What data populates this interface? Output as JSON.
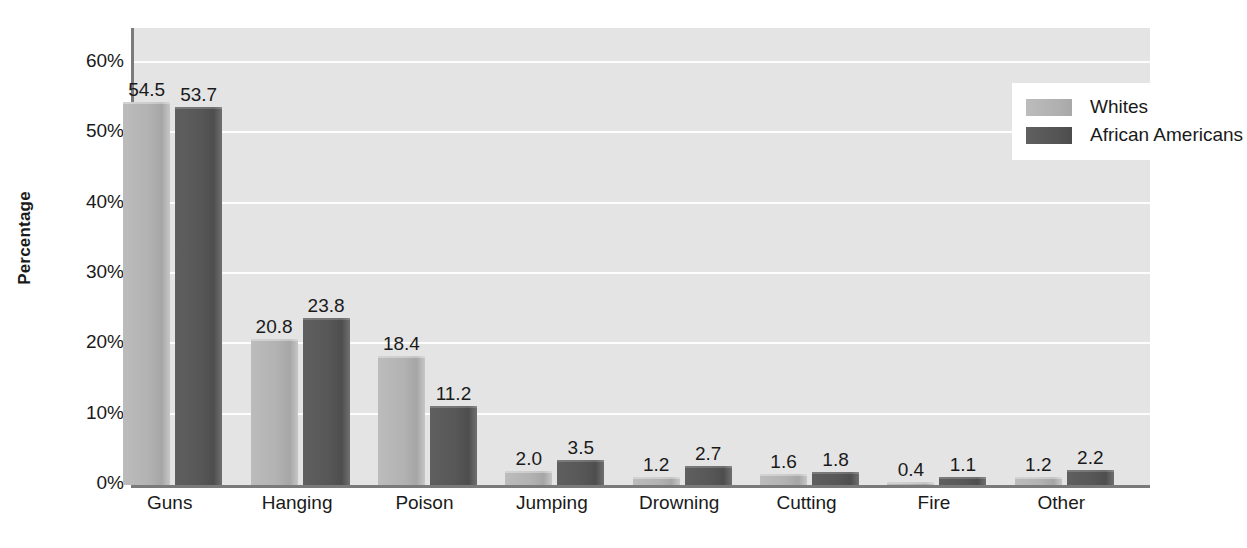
{
  "chart_data": {
    "type": "bar",
    "title": "",
    "xlabel": "",
    "ylabel": "Percentage",
    "ylim": [
      0,
      65
    ],
    "ytick_values": [
      0,
      10,
      20,
      30,
      40,
      50,
      60
    ],
    "ytick_labels": [
      "0%",
      "10%",
      "20%",
      "30%",
      "40%",
      "50%",
      "60%"
    ],
    "grid": true,
    "legend_position": "top-right",
    "categories": [
      "Guns",
      "Hanging",
      "Poison",
      "Jumping",
      "Drowning",
      "Cutting",
      "Fire",
      "Other"
    ],
    "series": [
      {
        "name": "Whites",
        "color": "#b0b0b0",
        "values": [
          54.5,
          20.8,
          18.4,
          2.0,
          1.2,
          1.6,
          0.4,
          1.2
        ],
        "labels": [
          "54.5",
          "20.8",
          "18.4",
          "2.0",
          "1.2",
          "1.6",
          "0.4",
          "1.2"
        ]
      },
      {
        "name": "African Americans",
        "color": "#565656",
        "values": [
          53.7,
          23.8,
          11.2,
          3.5,
          2.7,
          1.8,
          1.1,
          2.2
        ],
        "labels": [
          "53.7",
          "23.8",
          "11.2",
          "3.5",
          "2.7",
          "1.8",
          "1.1",
          "2.2"
        ]
      }
    ]
  },
  "colors": {
    "plot_background": "#e4e4e4",
    "page_background": "#ffffff",
    "gridline": "#fdfdfd",
    "axis_line": "#7a7a7a",
    "text": "#1a1a1a",
    "series_whites": "#b0b0b0",
    "series_african_americans": "#565656"
  },
  "legend": {
    "items": [
      {
        "label": "Whites",
        "series": 0
      },
      {
        "label": "African Americans",
        "series": 1
      }
    ]
  }
}
